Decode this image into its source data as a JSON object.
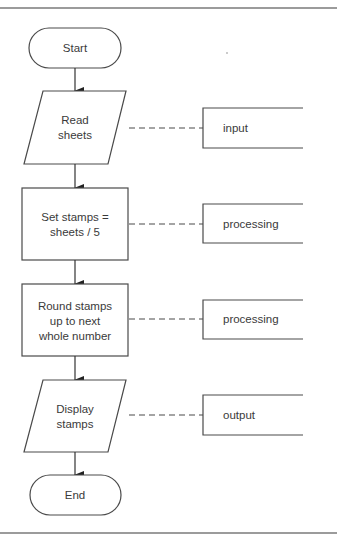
{
  "diagram": {
    "type": "flowchart",
    "steps": [
      {
        "id": "start",
        "shape": "terminal",
        "lines": [
          "Start"
        ]
      },
      {
        "id": "read",
        "shape": "input-output",
        "lines": [
          "Read",
          "sheets"
        ],
        "annotation": "input"
      },
      {
        "id": "set",
        "shape": "process",
        "lines": [
          "Set stamps =",
          "sheets / 5"
        ],
        "annotation": "processing"
      },
      {
        "id": "round",
        "shape": "process",
        "lines": [
          "Round stamps",
          "up to next",
          "whole number"
        ],
        "annotation": "processing"
      },
      {
        "id": "display",
        "shape": "input-output",
        "lines": [
          "Display",
          "stamps"
        ],
        "annotation": "output"
      },
      {
        "id": "end",
        "shape": "terminal",
        "lines": [
          "End"
        ]
      }
    ],
    "colors": {
      "stroke": "#4a4a4a",
      "text": "#3a3a3a",
      "background": "#ffffff",
      "rule": "#7a7a7a"
    }
  }
}
